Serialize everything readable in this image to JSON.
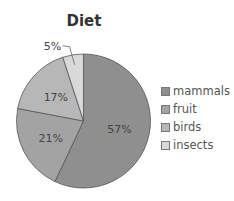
{
  "chart_data": {
    "type": "pie",
    "title": "Diet",
    "categories": [
      "mammals",
      "fruit",
      "birds",
      "insects"
    ],
    "values": [
      57,
      21,
      17,
      5
    ],
    "labels": [
      "57%",
      "21%",
      "17%",
      "5%"
    ],
    "colors": [
      "#8f8f8f",
      "#a3a3a3",
      "#b7b7b7",
      "#d9d9d9"
    ],
    "start_angle": "12 o'clock, clockwise",
    "legend_position": "right"
  }
}
